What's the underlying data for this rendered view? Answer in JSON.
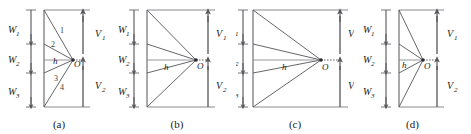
{
  "figure": {
    "title": "",
    "background": "#ffffff",
    "line_color": "#55555a",
    "text_color": "#1a1a1a",
    "width": 471,
    "height": 134
  },
  "panels": [
    {
      "id": "a",
      "caption": "(a)",
      "left": 0,
      "width": 118,
      "geometry": {
        "top_y": 10,
        "bottom_y": 107,
        "wall_x": 44,
        "origin_x": 73,
        "origin_y": 60,
        "w_axis_x": 31,
        "v_axis_x": 83,
        "w_breaks": [
          10,
          44,
          73,
          107
        ]
      },
      "labels": {
        "w1": "W",
        "w1_sub": "1",
        "w2": "W",
        "w2_sub": "2",
        "w3": "W",
        "w3_sub": "3",
        "v1": "V",
        "v1_sub": "1",
        "v2": "V",
        "v2_sub": "2",
        "h": "h",
        "o": "O"
      },
      "ray_numbers": [
        "1",
        "2",
        "3",
        "4"
      ]
    },
    {
      "id": "b",
      "caption": "(b)",
      "left": 118,
      "width": 118,
      "geometry": {
        "top_y": 10,
        "bottom_y": 107,
        "wall_x": 147,
        "origin_x": 196,
        "origin_y": 60,
        "w_axis_x": 134,
        "v_axis_x": 208,
        "w_breaks": [
          10,
          44,
          73,
          107
        ]
      },
      "labels": {
        "w1": "W",
        "w1_sub": "1",
        "w2": "W",
        "w2_sub": "2",
        "w3": "W",
        "w3_sub": "3",
        "v1": "V",
        "v1_sub": "1",
        "v2": "V",
        "v2_sub": "2",
        "h": "h",
        "o": "O"
      },
      "ray_numbers": []
    },
    {
      "id": "c",
      "caption": "(c)",
      "left": 236,
      "width": 118,
      "geometry": {
        "top_y": 10,
        "bottom_y": 107,
        "wall_x": 253,
        "origin_x": 321,
        "origin_y": 60,
        "w_axis_x": 243,
        "v_axis_x": 340,
        "w_breaks": [
          10,
          44,
          73,
          107
        ]
      },
      "labels": {
        "w1": "W",
        "w1_sub": "1",
        "w2": "W",
        "w2_sub": "2",
        "w3": "W",
        "w3_sub": "3",
        "v1": "V",
        "v1_sub": "1",
        "v2": "V",
        "v2_sub": "2",
        "h": "h",
        "o": "O"
      },
      "ray_numbers": []
    },
    {
      "id": "d",
      "caption": "(d)",
      "left": 354,
      "width": 117,
      "geometry": {
        "top_y": 10,
        "bottom_y": 107,
        "wall_x": 399,
        "origin_x": 423,
        "origin_y": 60,
        "w_axis_x": 386,
        "v_axis_x": 437,
        "w_breaks": [
          10,
          44,
          73,
          107
        ]
      },
      "labels": {
        "w1": "W",
        "w1_sub": "1",
        "w2": "W",
        "w2_sub": "2",
        "w3": "W",
        "w3_sub": "3",
        "v1": "V",
        "v1_sub": "1",
        "v2": "V",
        "v2_sub": "2",
        "h": "h",
        "o": "O"
      },
      "ray_numbers": []
    }
  ]
}
